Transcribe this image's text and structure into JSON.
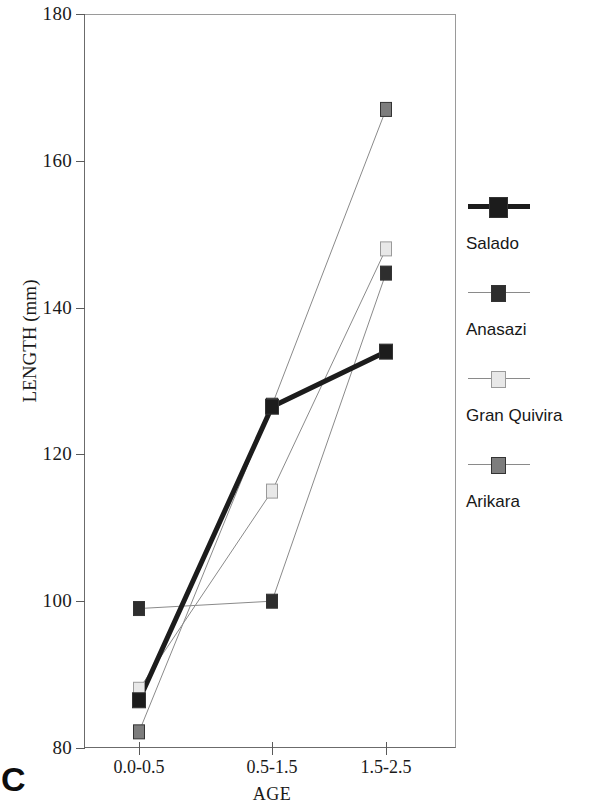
{
  "panel_letter": "C",
  "axes": {
    "y_title": "LENGTH (mm)",
    "x_title": "AGE",
    "y_ticks": [
      "180",
      "160",
      "140",
      "120",
      "100",
      "80"
    ],
    "x_ticks": [
      "0.0-0.5",
      "0.5-1.5",
      "1.5-2.5"
    ]
  },
  "legend": {
    "items": [
      {
        "label": "Salado",
        "marker": "filled-black-square-thick-line",
        "color": "#1c1c1c",
        "line": "thick"
      },
      {
        "label": "Anasazi",
        "marker": "filled-dark-square-thin-line",
        "color": "#2e2e2e",
        "line": "thin"
      },
      {
        "label": "Gran Quivira",
        "marker": "open-light-square-thin-line",
        "color": "#e8e8e8",
        "line": "thin"
      },
      {
        "label": "Arikara",
        "marker": "filled-gray-square-thin-line",
        "color": "#7d7d7d",
        "line": "thin"
      }
    ]
  },
  "chart_data": {
    "type": "line",
    "title": "",
    "xlabel": "AGE",
    "ylabel": "LENGTH (mm)",
    "categories": [
      "0.0-0.5",
      "0.5-1.5",
      "1.5-2.5"
    ],
    "ylim": [
      80,
      180
    ],
    "yticks": [
      80,
      100,
      120,
      140,
      160,
      180
    ],
    "grid": false,
    "legend_position": "right",
    "series": [
      {
        "name": "Salado",
        "values": [
          86.5,
          126.5,
          134.0
        ],
        "color": "#1c1c1c",
        "linewidth": 5,
        "marker": "square"
      },
      {
        "name": "Anasazi",
        "values": [
          99.0,
          100.0,
          144.7
        ],
        "color": "#2e2e2e",
        "linewidth": 1,
        "marker": "square"
      },
      {
        "name": "Gran Quivira",
        "values": [
          88.0,
          115.0,
          148.0
        ],
        "color": "#e8e8e8",
        "linewidth": 1,
        "marker": "square"
      },
      {
        "name": "Arikara",
        "values": [
          82.2,
          126.7,
          167.0
        ],
        "color": "#7d7d7d",
        "linewidth": 1,
        "marker": "square"
      }
    ]
  }
}
